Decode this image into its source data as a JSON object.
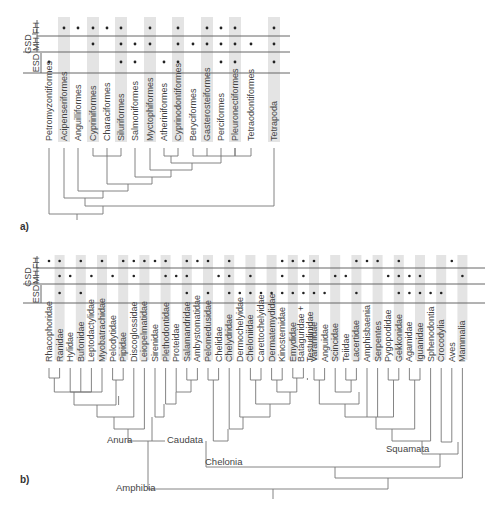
{
  "panel_a": {
    "label": "a)",
    "rows": [
      "GSD FH",
      "GSD MH",
      "ESD"
    ],
    "row_headers": {
      "gsd": "GSD",
      "fh": "FH",
      "mh": "MH",
      "esd": "ESD"
    },
    "taxa": [
      {
        "name": "Petromyzontiformes",
        "x": 49,
        "shaded": false,
        "fh": false,
        "mh": false,
        "esd": true
      },
      {
        "name": "Acipenseriformes",
        "x": 64,
        "shaded": true,
        "fh": true,
        "mh": false,
        "esd": false
      },
      {
        "name": "Anguilliformes",
        "x": 78,
        "shaded": false,
        "fh": true,
        "mh": false,
        "esd": false
      },
      {
        "name": "Cypriniformes",
        "x": 93,
        "shaded": true,
        "fh": true,
        "mh": true,
        "esd": false
      },
      {
        "name": "Characiformes",
        "x": 107,
        "shaded": false,
        "fh": true,
        "mh": false,
        "esd": false
      },
      {
        "name": "Siluriformes",
        "x": 121,
        "shaded": true,
        "fh": true,
        "mh": true,
        "esd": true
      },
      {
        "name": "Salmoniformes",
        "x": 135,
        "shaded": false,
        "fh": false,
        "mh": true,
        "esd": true
      },
      {
        "name": "Myctophiformes",
        "x": 150,
        "shaded": true,
        "fh": true,
        "mh": true,
        "esd": false
      },
      {
        "name": "Atheriniformes",
        "x": 164,
        "shaded": false,
        "fh": false,
        "mh": false,
        "esd": true
      },
      {
        "name": "Cyprinodontiformes",
        "x": 178,
        "shaded": true,
        "fh": true,
        "mh": true,
        "esd": true
      },
      {
        "name": "Beryciformes",
        "x": 193,
        "shaded": false,
        "fh": false,
        "mh": true,
        "esd": false
      },
      {
        "name": "Gasterosteiformes",
        "x": 207,
        "shaded": true,
        "fh": true,
        "mh": true,
        "esd": false
      },
      {
        "name": "Perciformes",
        "x": 221,
        "shaded": false,
        "fh": true,
        "mh": true,
        "esd": true
      },
      {
        "name": "Pleuronectiformes",
        "x": 235,
        "shaded": true,
        "fh": true,
        "mh": true,
        "esd": true
      },
      {
        "name": "Tetraodontiformes",
        "x": 251,
        "shaded": false,
        "fh": false,
        "mh": true,
        "esd": false
      },
      {
        "name": "Tetrapoda",
        "x": 274,
        "shaded": true,
        "fh": true,
        "mh": true,
        "esd": true
      }
    ]
  },
  "panel_b": {
    "label": "b)",
    "row_headers": {
      "gsd": "GSD",
      "fh": "FH",
      "mh": "MH",
      "esd": "ESD"
    },
    "clades": {
      "anura": "Anura",
      "caudata": "Caudata",
      "amphibia": "Amphibia",
      "chelonia": "Chelonia",
      "squamata": "Squamata"
    },
    "taxa": [
      {
        "name": "Rhacophoridae",
        "shaded": false,
        "fh": true,
        "mh": false,
        "esd": false
      },
      {
        "name": "Ranidae",
        "shaded": true,
        "fh": true,
        "mh": true,
        "esd": true
      },
      {
        "name": "Hylidae",
        "shaded": false,
        "fh": false,
        "mh": true,
        "esd": false
      },
      {
        "name": "Bufonidae",
        "shaded": true,
        "fh": true,
        "mh": false,
        "esd": true
      },
      {
        "name": "Leptodactylidae",
        "shaded": false,
        "fh": false,
        "mh": true,
        "esd": false
      },
      {
        "name": "Myobatrachidae",
        "shaded": true,
        "fh": true,
        "mh": false,
        "esd": false
      },
      {
        "name": "Pelodytidae",
        "shaded": false,
        "fh": false,
        "mh": true,
        "esd": false
      },
      {
        "name": "Pipidae",
        "shaded": true,
        "fh": true,
        "mh": false,
        "esd": false
      },
      {
        "name": "Discoglossidae",
        "shaded": false,
        "fh": true,
        "mh": true,
        "esd": false
      },
      {
        "name": "Leiopelmatidae",
        "shaded": true,
        "fh": true,
        "mh": false,
        "esd": false
      },
      {
        "name": "Sirenidae",
        "shaded": false,
        "fh": true,
        "mh": false,
        "esd": false
      },
      {
        "name": "Plethodontidae",
        "shaded": true,
        "fh": true,
        "mh": true,
        "esd": false
      },
      {
        "name": "Proteidae",
        "shaded": false,
        "fh": false,
        "mh": true,
        "esd": false
      },
      {
        "name": "Salamandridae",
        "shaded": true,
        "fh": true,
        "mh": true,
        "esd": true
      },
      {
        "name": "Ambystomatidae",
        "shaded": false,
        "fh": true,
        "mh": false,
        "esd": false
      },
      {
        "name": "Pelomedusidae",
        "shaded": true,
        "fh": true,
        "mh": false,
        "esd": true
      },
      {
        "name": "Chelidae",
        "shaded": false,
        "fh": false,
        "mh": true,
        "esd": false
      },
      {
        "name": "Chelydridae",
        "shaded": true,
        "fh": true,
        "mh": true,
        "esd": true
      },
      {
        "name": "Dermochelyidae",
        "shaded": false,
        "fh": false,
        "mh": false,
        "esd": true
      },
      {
        "name": "Cheloniidae",
        "shaded": true,
        "fh": false,
        "mh": true,
        "esd": true
      },
      {
        "name": "Carettochelyidae",
        "shaded": false,
        "fh": false,
        "mh": false,
        "esd": true
      },
      {
        "name": "Dermatemydidae",
        "shaded": true,
        "fh": false,
        "mh": false,
        "esd": true
      },
      {
        "name": "Kinosternidae",
        "shaded": false,
        "fh": true,
        "mh": true,
        "esd": true
      },
      {
        "name": "Emydidae",
        "shaded": true,
        "fh": true,
        "mh": false,
        "esd": true
      },
      {
        "name": "Bataguridae + Testudinidae",
        "shaded": false,
        "fh": true,
        "mh": true,
        "esd": true
      },
      {
        "name": "Varanidae",
        "shaded": true,
        "fh": true,
        "mh": false,
        "esd": true
      },
      {
        "name": "Anguidae",
        "shaded": false,
        "fh": false,
        "mh": false,
        "esd": true
      },
      {
        "name": "Scincidae",
        "shaded": true,
        "fh": false,
        "mh": true,
        "esd": false
      },
      {
        "name": "Teiidae",
        "shaded": false,
        "fh": false,
        "mh": true,
        "esd": false
      },
      {
        "name": "Lacertidae",
        "shaded": true,
        "fh": true,
        "mh": false,
        "esd": true
      },
      {
        "name": "Amphisbaenia",
        "shaded": false,
        "fh": true,
        "mh": false,
        "esd": false
      },
      {
        "name": "Serpentes",
        "shaded": true,
        "fh": true,
        "mh": false,
        "esd": false
      },
      {
        "name": "Pygopodidae",
        "shaded": false,
        "fh": false,
        "mh": true,
        "esd": false
      },
      {
        "name": "Gekkonidae",
        "shaded": true,
        "fh": true,
        "mh": true,
        "esd": true
      },
      {
        "name": "Agamidae",
        "shaded": false,
        "fh": false,
        "mh": true,
        "esd": true
      },
      {
        "name": "Iguanidae",
        "shaded": true,
        "fh": false,
        "mh": true,
        "esd": true
      },
      {
        "name": "Sphenodontia",
        "shaded": false,
        "fh": false,
        "mh": false,
        "esd": true
      },
      {
        "name": "Crocodylia",
        "shaded": true,
        "fh": false,
        "mh": false,
        "esd": true
      },
      {
        "name": "Aves",
        "shaded": false,
        "fh": true,
        "mh": false,
        "esd": false
      },
      {
        "name": "Mammalia",
        "shaded": true,
        "fh": false,
        "mh": true,
        "esd": false
      }
    ]
  }
}
